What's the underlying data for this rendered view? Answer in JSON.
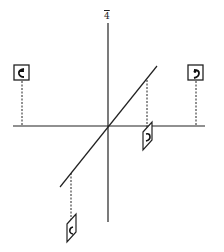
{
  "diagram": {
    "axis_label": "4",
    "stroke_color": "#222222",
    "background": "#ffffff",
    "origin": {
      "x": 108,
      "y": 126
    },
    "vertical_axis": {
      "x": 108,
      "y1": 23,
      "y2": 222
    },
    "horizontal_axis": {
      "y": 126,
      "x1": 13,
      "x2": 205
    },
    "diagonal_line": {
      "x1": 60,
      "y1": 187,
      "x2": 157,
      "y2": 66
    },
    "markers": [
      {
        "name": "marker-left",
        "type": "square",
        "cx": 18,
        "cy": 74,
        "glyph": "ʕ",
        "drop_to_y": 126,
        "anchor_x": 18
      },
      {
        "name": "marker-right",
        "type": "square",
        "cx": 196,
        "cy": 74,
        "glyph": "ˀ",
        "drop_to_y": 126,
        "anchor_x": 196
      },
      {
        "name": "marker-diag-upper",
        "type": "parallelogram",
        "cx": 147,
        "cy": 141,
        "glyph": "ˀ",
        "drop_from_y": 80,
        "anchor_x": 147
      },
      {
        "name": "marker-diag-lower",
        "type": "parallelogram",
        "cx": 71,
        "cy": 232,
        "glyph": "ʕ",
        "drop_from_y": 173,
        "anchor_x": 71
      }
    ]
  }
}
